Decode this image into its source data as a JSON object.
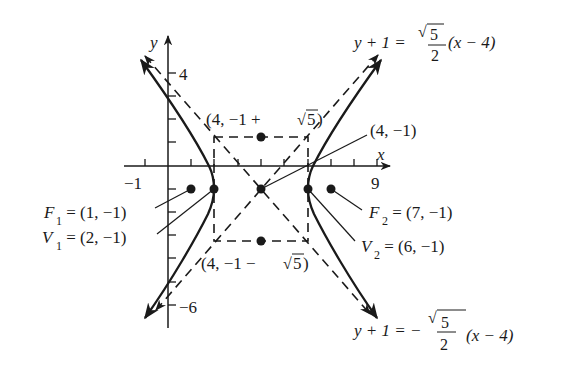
{
  "figure": {
    "type": "hyperbola-graph",
    "equation": "(x-4)^2/4 - (y+1)^2/5 = 1",
    "center": [
      4,
      -1
    ],
    "a": 2,
    "b_squared": 5,
    "colors": {
      "ink": "#1a1a1a",
      "background": "#ffffff"
    }
  },
  "axes": {
    "x_label": "x",
    "y_label": "y",
    "x_ticks": [
      -1,
      0,
      1,
      2,
      3,
      4,
      5,
      6,
      7,
      8,
      9
    ],
    "y_ticks": [
      4,
      3,
      2,
      1,
      -1,
      -2,
      -3,
      -4,
      -5,
      -6
    ],
    "x_tick_labels": {
      "neg_one": "−1",
      "nine": "9"
    },
    "y_tick_labels": {
      "four": "4",
      "neg_six": "−6"
    }
  },
  "labels": {
    "asymptote_pos": {
      "lhs": "y + 1 =",
      "sqrt_num": "5",
      "den": "2",
      "rhs": "(x − 4)"
    },
    "asymptote_neg": {
      "lhs": "y + 1 = −",
      "sqrt_num": "5",
      "den": "2",
      "rhs": "(x −  4)"
    },
    "top_point": {
      "prefix": "(4, −1 + ",
      "sqrt_num": "5",
      "suffix": ")"
    },
    "bottom_point": {
      "prefix": "(4, −1 −",
      "sqrt_num": "5",
      "suffix": ")"
    },
    "center_point": "(4, −1)",
    "f1": {
      "name": "F",
      "sub": "1",
      "value": " = (1, −1)"
    },
    "v1": {
      "name": "V",
      "sub": "1",
      "value": " = (2, −1)"
    },
    "f2": {
      "name": "F",
      "sub": "2",
      "value": " = (7, −1)"
    },
    "v2": {
      "name": "V",
      "sub": "2",
      "value": " = (6, −1)"
    }
  },
  "points": {
    "foci": [
      [
        1,
        -1
      ],
      [
        7,
        -1
      ]
    ],
    "vertices": [
      [
        2,
        -1
      ],
      [
        6,
        -1
      ]
    ],
    "center": [
      4,
      -1
    ],
    "conjugate_ends": [
      [
        4,
        1.236
      ],
      [
        4,
        -3.236
      ]
    ]
  }
}
